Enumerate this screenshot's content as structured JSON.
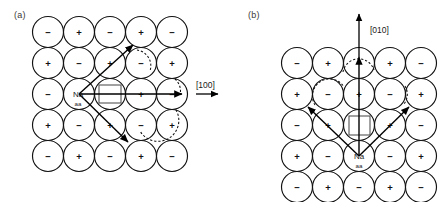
{
  "figure": {
    "type": "crystal-lattice-ion-migration-diagram",
    "background": "#ffffff",
    "stroke_color": "#111111",
    "width": 448,
    "height": 202
  },
  "panels": [
    {
      "id": "a",
      "label": "(a)",
      "direction_label": "[100]",
      "direction_axis": "horizontal-right",
      "site_label": "Na",
      "site_label_subscript": "aa",
      "vacancy_symbol": "square",
      "grid": {
        "rows": 5,
        "cols": 5,
        "circle_diameter": 31,
        "spacing": 31,
        "signs": [
          [
            "−",
            "+",
            "−",
            "+",
            "−"
          ],
          [
            "+",
            "−",
            "+",
            "−",
            "+"
          ],
          [
            "−",
            "+",
            "−",
            "+",
            "−"
          ],
          [
            "+",
            "−",
            "+",
            "−",
            "+"
          ],
          [
            "−",
            "+",
            "−",
            "+",
            "−"
          ]
        ]
      },
      "origin_site": {
        "row": 2,
        "col": 1
      },
      "vacancy_site": {
        "row": 2,
        "col": 2
      },
      "hop_arrows": [
        {
          "to_row": 1,
          "to_col": 3,
          "name": "hop-arrow-upper-diagonal"
        },
        {
          "to_row": 2,
          "to_col": 4,
          "name": "hop-arrow-horizontal"
        },
        {
          "to_row": 3,
          "to_col": 3,
          "name": "hop-arrow-lower-diagonal"
        }
      ],
      "dashed_arcs": 3
    },
    {
      "id": "b",
      "label": "(b)",
      "direction_label": "[010]",
      "direction_axis": "vertical-up",
      "site_label": "Na",
      "site_label_subscript": "aa",
      "vacancy_symbol": "square",
      "grid": {
        "rows": 5,
        "cols": 5,
        "circle_diameter": 31,
        "spacing": 31,
        "signs": [
          [
            "−",
            "+",
            "−",
            "+",
            "−"
          ],
          [
            "+",
            "−",
            "+",
            "−",
            "+"
          ],
          [
            "−",
            "+",
            "−",
            "+",
            "−"
          ],
          [
            "+",
            "−",
            "+",
            "−",
            "+"
          ],
          [
            "−",
            "+",
            "−",
            "+",
            "−"
          ]
        ]
      },
      "origin_site": {
        "row": 3,
        "col": 2
      },
      "vacancy_site": {
        "row": 2,
        "col": 2
      },
      "hop_arrows": [
        {
          "to_row": 1,
          "to_col": 0,
          "name": "hop-arrow-upper-left-diagonal"
        },
        {
          "to_row": 0,
          "to_col": 2,
          "name": "hop-arrow-vertical"
        },
        {
          "to_row": 1,
          "to_col": 4,
          "name": "hop-arrow-upper-right-diagonal"
        }
      ],
      "dashed_arcs": 3
    }
  ]
}
